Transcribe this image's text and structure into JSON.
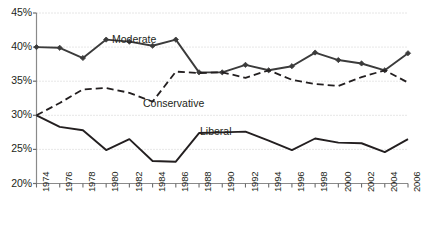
{
  "chart_data": {
    "type": "line",
    "title": "",
    "subtitle": "",
    "xlabel": "",
    "ylabel": "",
    "xlim": [
      1974,
      2006
    ],
    "ylim": [
      20,
      45
    ],
    "ytick_labels": [
      "45%",
      "40%",
      "35%",
      "30%",
      "25%",
      "20%"
    ],
    "ytick_values": [
      45,
      40,
      35,
      30,
      25,
      20
    ],
    "grid": "horizontal-dotted",
    "legend": "inline-annotations",
    "x": [
      1974,
      1976,
      1978,
      1980,
      1982,
      1984,
      1986,
      1988,
      1990,
      1992,
      1994,
      1996,
      1998,
      2000,
      2002,
      2004,
      2006
    ],
    "xtick_labels": [
      "1974",
      "1976",
      "1978",
      "1980",
      "1982",
      "1984",
      "1986",
      "1988",
      "1990",
      "1992",
      "1994",
      "1996",
      "1998",
      "2000",
      "2002",
      "2004",
      "2006"
    ],
    "series": [
      {
        "name": "Moderate",
        "style": "solid-with-diamond-markers",
        "color": "#3b3b3b",
        "values": [
          40.0,
          39.9,
          38.4,
          41.1,
          40.8,
          40.2,
          41.1,
          36.3,
          36.3,
          37.4,
          36.6,
          37.2,
          39.2,
          38.1,
          37.6,
          36.6,
          39.1
        ]
      },
      {
        "name": "Conservative",
        "style": "dashed",
        "color": "#231f20",
        "values": [
          30.0,
          31.8,
          33.8,
          34.0,
          33.3,
          32.0,
          36.4,
          36.2,
          36.3,
          35.5,
          36.6,
          35.2,
          34.6,
          34.3,
          35.6,
          36.6,
          34.8
        ]
      },
      {
        "name": "Liberal",
        "style": "solid",
        "color": "#231f20",
        "values": [
          30.0,
          28.3,
          27.8,
          24.9,
          26.5,
          23.3,
          23.2,
          27.4,
          27.5,
          27.6,
          26.3,
          24.9,
          26.6,
          26.0,
          25.9,
          24.6,
          26.5
        ]
      }
    ],
    "annotations": [
      {
        "text": "Moderate",
        "x_px": 112,
        "y_px": 34
      },
      {
        "text": "Conservative",
        "x_px": 143,
        "y_px": 98
      },
      {
        "text": "Liberal",
        "x_px": 200,
        "y_px": 126
      }
    ]
  }
}
